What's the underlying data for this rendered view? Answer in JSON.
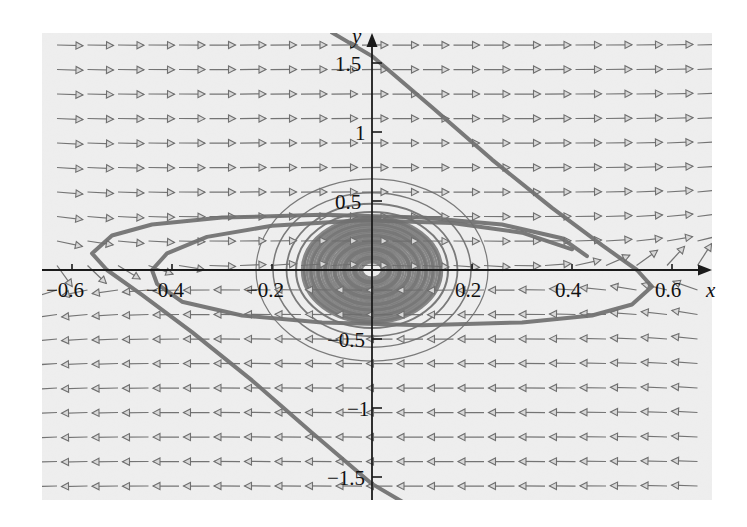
{
  "figure": {
    "kind": "phase-portrait",
    "background_color": "#eeeeee",
    "page_color": "#ffffff",
    "arrow_color": "#6e6e6e",
    "trajectory_color": "#707070",
    "axis_color": "#1a1a1a"
  },
  "axes": {
    "x_name": "x",
    "y_name": "y",
    "x_ticks": [
      {
        "value": -0.6,
        "label": "−0.6",
        "px": 72
      },
      {
        "value": -0.4,
        "label": "−0.4",
        "px": 172
      },
      {
        "value": -0.2,
        "label": "−0.2",
        "px": 272
      },
      {
        "value": 0.2,
        "label": "0.2",
        "px": 472
      },
      {
        "value": 0.4,
        "label": "0.4",
        "px": 572
      },
      {
        "value": 0.6,
        "label": "0.6",
        "px": 672
      }
    ],
    "y_ticks": [
      {
        "value": 1.5,
        "label": "1.5",
        "px": 63
      },
      {
        "value": 1.0,
        "label": "1",
        "px": 132
      },
      {
        "value": 0.5,
        "label": "0.5",
        "px": 201
      },
      {
        "value": -0.5,
        "label": "−0.5",
        "px": 339
      },
      {
        "value": -1.0,
        "label": "−1",
        "px": 408
      },
      {
        "value": -1.5,
        "label": "−1.5",
        "px": 477
      }
    ],
    "origin_px": {
      "x": 372,
      "y": 270
    },
    "scale_px_per_unit": {
      "x": 500,
      "y": 138
    },
    "x_range": [
      -0.66,
      0.68
    ],
    "y_range": [
      -1.72,
      1.72
    ]
  },
  "chart_data": {
    "type": "scatter",
    "title": "",
    "xlabel": "x",
    "ylabel": "y",
    "grid": false,
    "legend": null,
    "xlim": [
      -0.66,
      0.68
    ],
    "ylim": [
      -1.72,
      1.72
    ],
    "vector_field": {
      "grid_spacing_px": {
        "x": 30.5,
        "y": 24.5
      },
      "arrow_length_px": 26,
      "n_columns": 22,
      "n_rows": 19,
      "model": "dx/dt = y ; dy/dt = -sin-like restoring force scaled by 1/x-scale, producing ellipse-shaped level curves near the origin"
    },
    "closed_orbits": {
      "count": 11,
      "shape": "ellipse",
      "center": [
        0.0,
        0.0
      ],
      "semi_axes_x": [
        0.035,
        0.055,
        0.075,
        0.093,
        0.108,
        0.122,
        0.136,
        0.152,
        0.171,
        0.198,
        0.232
      ],
      "semi_axes_y": [
        0.09,
        0.15,
        0.2,
        0.25,
        0.29,
        0.33,
        0.37,
        0.42,
        0.48,
        0.56,
        0.66
      ]
    },
    "separatrices": [
      {
        "name": "upper-right branch",
        "points": [
          [
            -0.08,
            1.72
          ],
          [
            0.0,
            1.55
          ],
          [
            0.12,
            1.18
          ],
          [
            0.24,
            0.8
          ],
          [
            0.36,
            0.45
          ],
          [
            0.46,
            0.18
          ],
          [
            0.53,
            0.0
          ],
          [
            0.56,
            -0.12
          ],
          [
            0.52,
            -0.25
          ],
          [
            0.44,
            -0.33
          ],
          [
            0.3,
            -0.38
          ],
          [
            0.1,
            -0.4
          ],
          [
            -0.1,
            -0.38
          ],
          [
            -0.26,
            -0.33
          ],
          [
            -0.38,
            -0.23
          ],
          [
            -0.43,
            -0.1
          ],
          [
            -0.44,
            0.0
          ],
          [
            -0.41,
            0.12
          ],
          [
            -0.33,
            0.24
          ],
          [
            -0.2,
            0.32
          ],
          [
            -0.02,
            0.36
          ],
          [
            0.16,
            0.34
          ],
          [
            0.3,
            0.27
          ],
          [
            0.4,
            0.15
          ]
        ]
      },
      {
        "name": "lower-left branch",
        "points": [
          [
            0.08,
            -1.72
          ],
          [
            0.0,
            -1.55
          ],
          [
            -0.12,
            -1.18
          ],
          [
            -0.24,
            -0.8
          ],
          [
            -0.36,
            -0.45
          ],
          [
            -0.46,
            -0.18
          ],
          [
            -0.53,
            0.0
          ],
          [
            -0.56,
            0.12
          ],
          [
            -0.52,
            0.25
          ],
          [
            -0.44,
            0.33
          ],
          [
            -0.3,
            0.38
          ],
          [
            -0.1,
            0.4
          ],
          [
            0.1,
            0.38
          ],
          [
            0.26,
            0.33
          ],
          [
            0.38,
            0.23
          ],
          [
            0.43,
            0.1
          ]
        ]
      }
    ]
  }
}
